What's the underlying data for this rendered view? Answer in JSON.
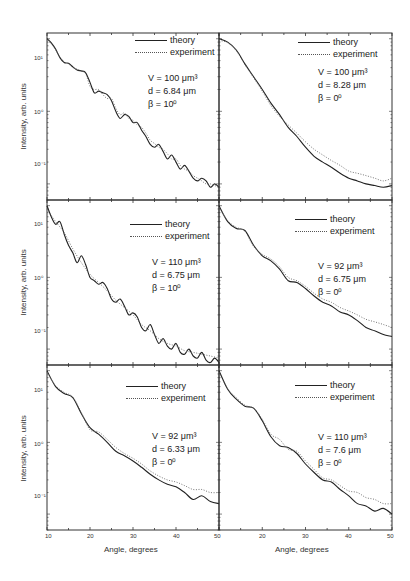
{
  "figure": {
    "ylabel": "Intensity, arb. units",
    "xlabel": "Angle, degrees",
    "xticks": [
      "10",
      "20",
      "30",
      "40",
      "50"
    ],
    "yticks_left": [
      "10¹",
      "10⁰",
      "10⁻¹"
    ],
    "legend": {
      "theory": "theory",
      "experiment": "experiment"
    }
  },
  "chart_data": [
    {
      "type": "line",
      "panel": "top-left",
      "title": "",
      "xlabel": "",
      "ylabel": "Intensity, arb. units",
      "xlim": [
        10,
        50
      ],
      "yscale": "log",
      "params": {
        "V": "V = 100 μm³",
        "d": "d = 6.84 μm",
        "beta": "β = 10⁰"
      },
      "series": [
        {
          "name": "theory",
          "x": [
            10,
            11,
            12,
            13,
            14,
            15,
            16,
            17,
            18,
            19,
            20,
            21,
            22,
            23,
            24,
            25,
            26,
            27,
            28,
            29,
            30,
            31,
            32,
            33,
            34,
            35,
            36,
            37,
            38,
            39,
            40,
            41,
            42,
            43,
            44,
            45,
            46,
            47,
            48,
            49,
            50
          ],
          "y": [
            1.0,
            0.88,
            0.72,
            0.55,
            0.47,
            0.46,
            0.41,
            0.37,
            0.36,
            0.34,
            0.25,
            0.18,
            0.19,
            0.18,
            0.17,
            0.14,
            0.1,
            0.08,
            0.09,
            0.085,
            0.07,
            0.07,
            0.055,
            0.045,
            0.035,
            0.032,
            0.035,
            0.028,
            0.022,
            0.025,
            0.02,
            0.016,
            0.018,
            0.015,
            0.012,
            0.011,
            0.012,
            0.011,
            0.009,
            0.01,
            0.009
          ]
        },
        {
          "name": "experiment",
          "x": [
            10,
            11,
            12,
            13,
            14,
            15,
            16,
            17,
            18,
            19,
            20,
            21,
            22,
            23,
            24,
            25,
            26,
            27,
            28,
            29,
            30,
            31,
            32,
            33,
            34,
            35,
            36,
            37,
            38,
            39,
            40,
            41,
            42,
            43,
            44,
            45,
            46,
            47,
            48,
            49,
            50
          ],
          "y": [
            0.95,
            0.85,
            0.7,
            0.56,
            0.48,
            0.45,
            0.4,
            0.38,
            0.36,
            0.33,
            0.22,
            0.2,
            0.2,
            0.17,
            0.15,
            0.15,
            0.11,
            0.09,
            0.095,
            0.08,
            0.075,
            0.065,
            0.06,
            0.05,
            0.04,
            0.036,
            0.032,
            0.03,
            0.026,
            0.022,
            0.022,
            0.018,
            0.016,
            0.015,
            0.013,
            0.012,
            0.011,
            0.01,
            0.01,
            0.0095,
            0.009
          ]
        }
      ]
    },
    {
      "type": "line",
      "panel": "top-right",
      "xlim": [
        10,
        50
      ],
      "yscale": "log",
      "params": {
        "V": "V = 100 μm³",
        "d": "d = 8.28 μm",
        "beta": "β = 0⁰"
      },
      "series": [
        {
          "name": "theory",
          "x": [
            10,
            12,
            14,
            16,
            18,
            20,
            22,
            24,
            26,
            28,
            30,
            32,
            34,
            36,
            38,
            40,
            42,
            44,
            46,
            48,
            50
          ],
          "y": [
            1.0,
            0.9,
            0.7,
            0.45,
            0.3,
            0.2,
            0.13,
            0.09,
            0.06,
            0.045,
            0.032,
            0.024,
            0.02,
            0.017,
            0.014,
            0.012,
            0.011,
            0.01,
            0.0095,
            0.009,
            0.0095
          ]
        },
        {
          "name": "experiment",
          "x": [
            10,
            12,
            14,
            16,
            18,
            20,
            22,
            24,
            26,
            28,
            30,
            32,
            34,
            36,
            38,
            40,
            42,
            44,
            46,
            48,
            50
          ],
          "y": [
            0.95,
            0.88,
            0.68,
            0.44,
            0.29,
            0.19,
            0.12,
            0.085,
            0.065,
            0.05,
            0.038,
            0.03,
            0.025,
            0.021,
            0.018,
            0.015,
            0.014,
            0.013,
            0.012,
            0.011,
            0.012
          ]
        }
      ]
    },
    {
      "type": "line",
      "panel": "middle-left",
      "xlim": [
        10,
        50
      ],
      "yscale": "log",
      "params": {
        "V": "V = 110 μm³",
        "d": "d = 6.75 μm",
        "beta": "β = 10⁰"
      },
      "series": [
        {
          "name": "theory",
          "x": [
            10,
            11,
            12,
            13,
            14,
            15,
            16,
            17,
            18,
            19,
            20,
            21,
            22,
            23,
            24,
            25,
            26,
            27,
            28,
            29,
            30,
            31,
            32,
            33,
            34,
            35,
            36,
            37,
            38,
            39,
            40,
            41,
            42,
            43,
            44,
            45,
            46,
            47,
            48,
            49,
            50
          ],
          "y": [
            1.0,
            0.7,
            0.55,
            0.6,
            0.4,
            0.28,
            0.22,
            0.16,
            0.2,
            0.15,
            0.1,
            0.09,
            0.08,
            0.085,
            0.07,
            0.05,
            0.045,
            0.05,
            0.04,
            0.03,
            0.032,
            0.028,
            0.02,
            0.018,
            0.022,
            0.016,
            0.012,
            0.014,
            0.011,
            0.01,
            0.012,
            0.009,
            0.0085,
            0.01,
            0.008,
            0.0075,
            0.009,
            0.007,
            0.0065,
            0.0075,
            0.0065
          ]
        },
        {
          "name": "experiment",
          "x": [
            10,
            12,
            14,
            16,
            18,
            20,
            22,
            24,
            26,
            28,
            30,
            32,
            34,
            36,
            38,
            40,
            42,
            44,
            46,
            48,
            50
          ],
          "y": [
            0.9,
            0.6,
            0.42,
            0.25,
            0.16,
            0.11,
            0.085,
            0.065,
            0.048,
            0.038,
            0.03,
            0.022,
            0.018,
            0.014,
            0.012,
            0.011,
            0.0095,
            0.009,
            0.0085,
            0.008,
            0.0075
          ]
        }
      ]
    },
    {
      "type": "line",
      "panel": "middle-right",
      "xlim": [
        10,
        50
      ],
      "yscale": "log",
      "params": {
        "V": "V = 92 μm³",
        "d": "d = 6.75 μm",
        "beta": "β = 0⁰"
      },
      "series": [
        {
          "name": "theory",
          "x": [
            10,
            12,
            14,
            16,
            18,
            20,
            22,
            24,
            26,
            28,
            30,
            32,
            34,
            36,
            38,
            40,
            42,
            44,
            46,
            48,
            50
          ],
          "y": [
            1.0,
            0.6,
            0.48,
            0.45,
            0.28,
            0.2,
            0.17,
            0.13,
            0.09,
            0.085,
            0.07,
            0.055,
            0.045,
            0.04,
            0.033,
            0.03,
            0.025,
            0.02,
            0.018,
            0.016,
            0.015
          ]
        },
        {
          "name": "experiment",
          "x": [
            10,
            12,
            14,
            16,
            18,
            20,
            22,
            24,
            26,
            28,
            30,
            32,
            34,
            36,
            38,
            40,
            42,
            44,
            46,
            48,
            50
          ],
          "y": [
            0.95,
            0.62,
            0.5,
            0.44,
            0.27,
            0.21,
            0.18,
            0.14,
            0.1,
            0.09,
            0.075,
            0.06,
            0.05,
            0.045,
            0.038,
            0.034,
            0.03,
            0.026,
            0.024,
            0.022,
            0.02
          ]
        }
      ]
    },
    {
      "type": "line",
      "panel": "bottom-left",
      "xlim": [
        10,
        50
      ],
      "yscale": "log",
      "xlabel": "Angle, degrees",
      "params": {
        "V": "V = 92 μm³",
        "d": "d = 6.33 μm",
        "beta": "β = 0⁰"
      },
      "series": [
        {
          "name": "theory",
          "x": [
            10,
            12,
            14,
            16,
            18,
            20,
            22,
            24,
            26,
            28,
            30,
            32,
            34,
            36,
            38,
            40,
            42,
            44,
            46,
            48,
            50
          ],
          "y": [
            1.0,
            0.6,
            0.48,
            0.42,
            0.25,
            0.16,
            0.13,
            0.1,
            0.075,
            0.065,
            0.055,
            0.045,
            0.036,
            0.03,
            0.026,
            0.024,
            0.02,
            0.016,
            0.018,
            0.015,
            0.014
          ]
        },
        {
          "name": "experiment",
          "x": [
            10,
            12,
            14,
            16,
            18,
            20,
            22,
            24,
            26,
            28,
            30,
            32,
            34,
            36,
            38,
            40,
            42,
            44,
            46,
            48,
            50
          ],
          "y": [
            0.95,
            0.62,
            0.5,
            0.43,
            0.26,
            0.15,
            0.14,
            0.11,
            0.085,
            0.07,
            0.06,
            0.05,
            0.04,
            0.034,
            0.03,
            0.028,
            0.025,
            0.022,
            0.022,
            0.02,
            0.02
          ]
        }
      ]
    },
    {
      "type": "line",
      "panel": "bottom-right",
      "xlim": [
        10,
        50
      ],
      "yscale": "log",
      "xlabel": "Angle, degrees",
      "params": {
        "V": "V = 110 μm³",
        "d": "d = 7.6 μm",
        "beta": "β = 0⁰"
      },
      "series": [
        {
          "name": "theory",
          "x": [
            10,
            12,
            14,
            16,
            18,
            20,
            22,
            24,
            26,
            28,
            30,
            32,
            34,
            36,
            38,
            40,
            42,
            44,
            46,
            48,
            50
          ],
          "y": [
            1.0,
            0.55,
            0.4,
            0.32,
            0.3,
            0.2,
            0.12,
            0.09,
            0.085,
            0.07,
            0.05,
            0.038,
            0.03,
            0.028,
            0.022,
            0.018,
            0.014,
            0.013,
            0.011,
            0.012,
            0.01
          ]
        },
        {
          "name": "experiment",
          "x": [
            10,
            12,
            14,
            16,
            18,
            20,
            22,
            24,
            26,
            28,
            30,
            32,
            34,
            36,
            38,
            40,
            42,
            44,
            46,
            48,
            50
          ],
          "y": [
            0.95,
            0.56,
            0.42,
            0.33,
            0.3,
            0.21,
            0.13,
            0.11,
            0.08,
            0.075,
            0.055,
            0.042,
            0.032,
            0.03,
            0.025,
            0.021,
            0.02,
            0.017,
            0.016,
            0.014,
            0.014
          ]
        }
      ]
    }
  ]
}
